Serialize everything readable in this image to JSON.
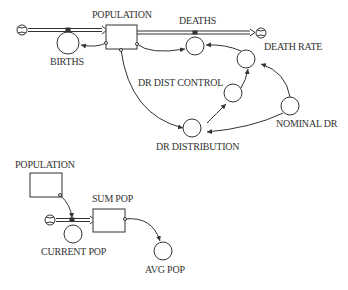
{
  "diagram": {
    "type": "stock-and-flow",
    "stocks": [
      {
        "id": "population",
        "label": "POPULATION"
      },
      {
        "id": "population_ghost",
        "label": "POPULATION"
      },
      {
        "id": "sum_pop",
        "label": "SUM POP"
      }
    ],
    "flows": [
      {
        "id": "births",
        "label": "BIRTHS"
      },
      {
        "id": "deaths",
        "label": "DEATHS"
      },
      {
        "id": "current_pop",
        "label": "CURRENT POP"
      }
    ],
    "auxiliaries": [
      {
        "id": "death_rate",
        "label": "DEATH RATE"
      },
      {
        "id": "dr_dist_control",
        "label": "DR DIST CONTROL"
      },
      {
        "id": "dr_distribution",
        "label": "DR DISTRIBUTION"
      },
      {
        "id": "nominal_dr",
        "label": "NOMINAL DR"
      },
      {
        "id": "avg_pop",
        "label": "AVG POP"
      }
    ],
    "colors": {
      "line": "#333333",
      "background": "#ffffff"
    }
  }
}
